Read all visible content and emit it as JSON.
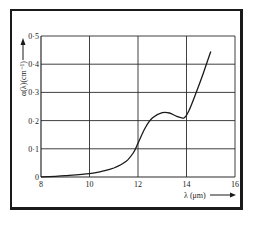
{
  "chart_data": {
    "type": "line",
    "title": "",
    "xlabel": "λ (μm)",
    "ylabel": "α(λ)(cm⁻¹)",
    "xlim": [
      8,
      16
    ],
    "ylim": [
      0,
      0.5
    ],
    "x_ticks": [
      "8",
      "10",
      "12",
      "14",
      "16"
    ],
    "y_ticks": [
      "0",
      "0·1",
      "0·2",
      "0·3",
      "0·4",
      "0·5"
    ],
    "grid": true,
    "legend": null,
    "series": [
      {
        "name": "absorption coefficient",
        "x": [
          8.0,
          9.0,
          10.0,
          10.5,
          11.0,
          11.5,
          11.8,
          12.0,
          12.3,
          12.6,
          13.0,
          13.3,
          13.6,
          13.9,
          14.1,
          14.4,
          14.7,
          15.0
        ],
        "y": [
          0.0,
          0.005,
          0.012,
          0.02,
          0.032,
          0.055,
          0.085,
          0.12,
          0.175,
          0.21,
          0.228,
          0.227,
          0.215,
          0.21,
          0.235,
          0.3,
          0.37,
          0.445
        ]
      }
    ]
  },
  "labels": {
    "x_axis_label": "λ (μm)",
    "y_axis_label": "α(λ)(cm⁻¹)",
    "x_ticks": [
      "8",
      "10",
      "12",
      "14",
      "16"
    ],
    "y_ticks": [
      "0",
      "0·1",
      "0·2",
      "0·3",
      "0·4",
      "0·5"
    ]
  },
  "colors": {
    "line": "#1a1a1a",
    "grid": "#2a2a2a",
    "background": "#ffffff"
  }
}
